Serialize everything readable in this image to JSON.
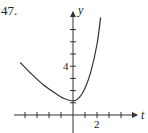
{
  "problem": {
    "number": "47."
  },
  "chart_data": {
    "type": "line",
    "title": "",
    "xlabel": "t",
    "ylabel": "y",
    "x_tick_label": "2",
    "y_tick_label": "4",
    "x_ticks": [
      -4,
      -3,
      -2,
      -1,
      1,
      2,
      3,
      4
    ],
    "y_ticks": [
      1,
      2,
      3,
      4,
      5,
      6,
      7
    ],
    "xlim": [
      -4.5,
      4.5
    ],
    "ylim": [
      -1.2,
      8.5
    ],
    "grid": false,
    "series": [
      {
        "name": "y(t)",
        "x": [
          -4.4,
          -3.5,
          -2.5,
          -1.5,
          -0.75,
          0,
          0.5,
          1.0,
          1.5,
          2.0,
          2.3
        ],
        "y": [
          4.3,
          3.4,
          2.5,
          1.8,
          1.35,
          1.15,
          1.4,
          2.2,
          3.6,
          5.8,
          8.0
        ]
      }
    ],
    "colors": {
      "axis": "#333333",
      "curve": "#333333"
    }
  }
}
